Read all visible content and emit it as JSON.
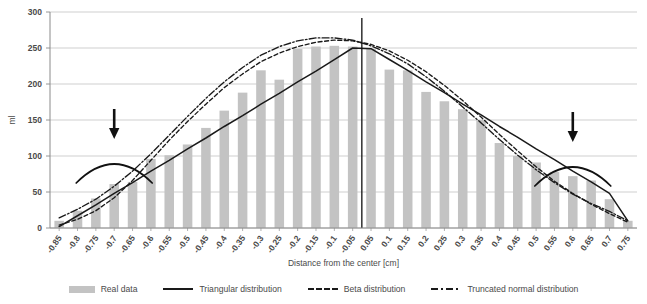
{
  "chart_data": {
    "type": "bar",
    "title": "",
    "xlabel": "Distance from the center [cm]",
    "ylabel": "ml",
    "ylim": [
      0,
      300
    ],
    "yticks": [
      0,
      50,
      100,
      150,
      200,
      250,
      300
    ],
    "grid": true,
    "legend_position": "bottom",
    "categories": [
      "-0.85",
      "-0.8",
      "-0.75",
      "-0.7",
      "-0.65",
      "-0.6",
      "-0.55",
      "-0.5",
      "-0.45",
      "-0.4",
      "-0.35",
      "-0.3",
      "-0.25",
      "-0.2",
      "-0.15",
      "-0.1",
      "-0.05",
      "0.05",
      "0.1",
      "0.15",
      "0.2",
      "0.25",
      "0.3",
      "0.35",
      "0.4",
      "0.45",
      "0.5",
      "0.55",
      "0.6",
      "0.65",
      "0.7",
      "0.75"
    ],
    "series": [
      {
        "name": "Real data",
        "type": "bar",
        "color": "#c3c3c3",
        "values": [
          10,
          24,
          41,
          61,
          64,
          96,
          101,
          116,
          139,
          163,
          188,
          219,
          206,
          249,
          252,
          253,
          252,
          249,
          220,
          219,
          189,
          176,
          165,
          150,
          118,
          100,
          91,
          78,
          72,
          66,
          40,
          10
        ]
      },
      {
        "name": "Triangular distribution",
        "type": "line",
        "style": "solid",
        "color": "#1a1a1a",
        "values": [
          2,
          17,
          32,
          48,
          63,
          79,
          94,
          110,
          125,
          141,
          156,
          172,
          187,
          203,
          218,
          234,
          250,
          249,
          234,
          219,
          203,
          188,
          172,
          157,
          141,
          126,
          110,
          95,
          79,
          64,
          48,
          10
        ]
      },
      {
        "name": "Beta distribution",
        "type": "line",
        "style": "dashed",
        "color": "#1a1a1a",
        "values": [
          4,
          12,
          24,
          42,
          66,
          94,
          122,
          148,
          172,
          195,
          214,
          231,
          243,
          252,
          258,
          261,
          260,
          255,
          246,
          233,
          217,
          198,
          177,
          154,
          130,
          107,
          85,
          65,
          48,
          33,
          20,
          8
        ]
      },
      {
        "name": "Truncated normal distribution",
        "type": "line",
        "style": "dashdot",
        "color": "#1a1a1a",
        "values": [
          14,
          26,
          40,
          58,
          79,
          103,
          129,
          155,
          180,
          203,
          223,
          240,
          252,
          260,
          264,
          264,
          261,
          253,
          242,
          228,
          210,
          190,
          168,
          146,
          123,
          101,
          81,
          63,
          47,
          34,
          23,
          10
        ]
      }
    ],
    "annotations": [
      {
        "name": "left-arrow",
        "label": "",
        "x_category": "-0.7",
        "kind": "down-arrow-with-arc"
      },
      {
        "name": "right-arrow",
        "label": "",
        "x_category": "0.6",
        "kind": "down-arrow-with-arc"
      },
      {
        "name": "center-line",
        "label": "",
        "x_category": "0.05",
        "kind": "vertical-line"
      }
    ]
  },
  "legend": {
    "items": [
      {
        "label": "Real data",
        "marker": "bar-swatch"
      },
      {
        "label": "Triangular distribution",
        "marker": "solid-line"
      },
      {
        "label": "Beta distribution",
        "marker": "dashed-line"
      },
      {
        "label": "Truncated normal distribution",
        "marker": "dashdot-line"
      }
    ]
  }
}
